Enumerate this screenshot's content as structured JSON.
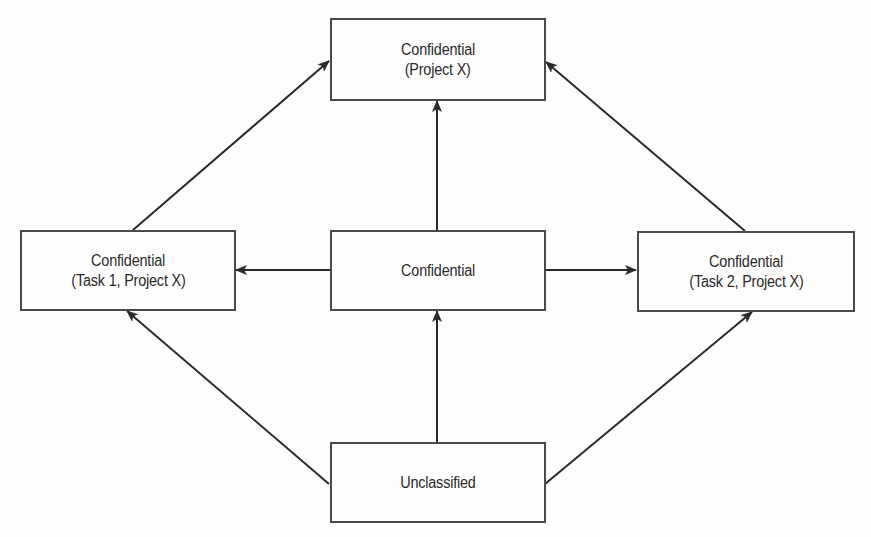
{
  "diagram": {
    "type": "lattice",
    "colors": {
      "line": "#2a2a2a",
      "box_border": "#4a4a4a",
      "text": "#2a2a2a",
      "background": "#fdfdfc"
    },
    "nodes": {
      "top": {
        "line1": "Confidential",
        "line2": "(Project X)"
      },
      "left": {
        "line1": "Confidential",
        "line2": "(Task 1, Project X)"
      },
      "middle": {
        "line1": "Confidential",
        "line2": ""
      },
      "right": {
        "line1": "Confidential",
        "line2": "(Task 2, Project X)"
      },
      "bottom": {
        "line1": "Unclassified",
        "line2": ""
      }
    },
    "edges": [
      {
        "from": "Unclassified",
        "to": "Confidential"
      },
      {
        "from": "Unclassified",
        "to": "Confidential (Task 1, Project X)"
      },
      {
        "from": "Unclassified",
        "to": "Confidential (Task 2, Project X)"
      },
      {
        "from": "Confidential",
        "to": "Confidential (Task 1, Project X)"
      },
      {
        "from": "Confidential",
        "to": "Confidential (Task 2, Project X)"
      },
      {
        "from": "Confidential",
        "to": "Confidential (Project X)"
      },
      {
        "from": "Confidential (Task 1, Project X)",
        "to": "Confidential (Project X)"
      },
      {
        "from": "Confidential (Task 2, Project X)",
        "to": "Confidential (Project X)"
      }
    ]
  }
}
